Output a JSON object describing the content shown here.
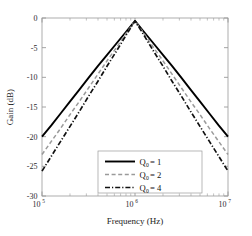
{
  "chart_data": {
    "type": "line",
    "title": "",
    "subtitle": "",
    "xlabel": "Frequency (Hz)",
    "ylabel": "Gain (dB)",
    "xscale": "log",
    "yscale": "linear",
    "xlim": [
      100000,
      10000000
    ],
    "ylim": [
      -30,
      0
    ],
    "grid": false,
    "legend_position": "lower-center",
    "xtick_labels": [
      "10^5",
      "10^6",
      "10^7"
    ],
    "xtick_values": [
      100000,
      1000000,
      10000000
    ],
    "xtick_mantissas": [
      "10",
      "10",
      "10"
    ],
    "xtick_exponents": [
      "5",
      "6",
      "7"
    ],
    "ytick_labels": [
      "0",
      "-5",
      "-10",
      "-15",
      "-20",
      "-25",
      "-30"
    ],
    "ytick_values": [
      0,
      -5,
      -10,
      -15,
      -20,
      -25,
      -30
    ],
    "annotations": [],
    "x": [
      100000,
      125893,
      158489,
      199526,
      251189,
      316228,
      398107,
      501187,
      630957,
      794328,
      1000000,
      1258925,
      1584893,
      1995262,
      2511886,
      3162278,
      3981072,
      5011872,
      6309573,
      7943282,
      10000000
    ],
    "series": [
      {
        "name": "Q₀ = 1",
        "legend_label": "Q0 = 1",
        "q_value": 1,
        "color": "#000000",
        "linestyle": "solid",
        "linewidth": 1.9,
        "peak_gain_db": -0.5,
        "peak_frequency_hz": 1000000,
        "values": [
          -20.0,
          -18.1,
          -16.1,
          -14.1,
          -12.1,
          -10.1,
          -8.1,
          -6.2,
          -4.3,
          -2.4,
          -0.5,
          -2.4,
          -4.3,
          -6.2,
          -8.1,
          -10.1,
          -12.1,
          -14.1,
          -16.1,
          -18.1,
          -20.0
        ]
      },
      {
        "name": "Q₀ = 2",
        "legend_label": "Q0 = 2",
        "q_value": 2,
        "color": "#9a9a9a",
        "linestyle": "dashed",
        "linewidth": 1.5,
        "peak_gain_db": -0.5,
        "peak_frequency_hz": 1000000,
        "values": [
          -23.0,
          -20.8,
          -18.6,
          -16.3,
          -14.1,
          -11.8,
          -9.5,
          -7.2,
          -5.0,
          -2.7,
          -0.5,
          -2.7,
          -5.0,
          -7.2,
          -9.5,
          -11.8,
          -14.1,
          -16.3,
          -18.6,
          -20.8,
          -23.0
        ]
      },
      {
        "name": "Q₀ = 4",
        "legend_label": "Q0 = 4",
        "q_value": 4,
        "color": "#111111",
        "linestyle": "dashdot",
        "linewidth": 1.7,
        "peak_gain_db": -0.5,
        "peak_frequency_hz": 1000000,
        "values": [
          -25.8,
          -23.3,
          -20.8,
          -18.3,
          -15.8,
          -13.2,
          -10.7,
          -8.1,
          -5.6,
          -3.0,
          -0.5,
          -3.0,
          -5.6,
          -8.1,
          -10.7,
          -13.2,
          -15.8,
          -18.3,
          -20.8,
          -23.3,
          -25.8
        ]
      }
    ]
  },
  "legend": {
    "entries": [
      {
        "symbol": "Q",
        "subscript": "0",
        "equals": " = ",
        "value": "1"
      },
      {
        "symbol": "Q",
        "subscript": "0",
        "equals": " = ",
        "value": "2"
      },
      {
        "symbol": "Q",
        "subscript": "0",
        "equals": " = ",
        "value": "4"
      }
    ]
  },
  "colors": {
    "axis": "#9a9a9a",
    "text": "#1c1c1c",
    "series_1": "#000000",
    "series_2": "#9a9a9a",
    "series_3": "#111111",
    "background": "#ffffff"
  }
}
